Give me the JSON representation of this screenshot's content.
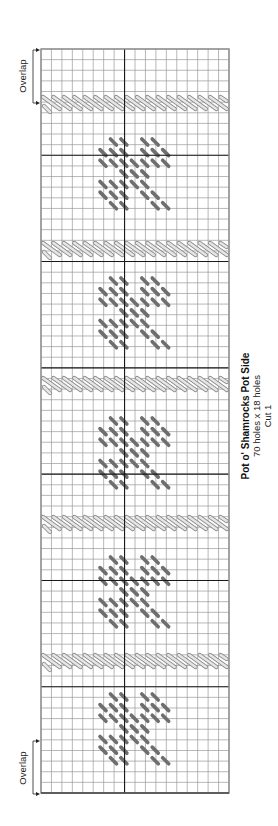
{
  "title": "Pot o' Shamrocks Pot Side",
  "dimensions": "70 holes x 18 holes",
  "cut": "Cut 1",
  "overlap_top": "Overlap",
  "overlap_bottom": "Overlap",
  "grid": {
    "rows": 70,
    "cols": 18,
    "left": 41,
    "top": 49,
    "width": 188,
    "height": 744,
    "major_every": 10,
    "center_col": 8,
    "line_color": "#9a9a9a",
    "major_color": "#1a1a1a",
    "border_color": "#8c8c8c"
  },
  "colors": {
    "shamrock_stitch": "#6e6e6e",
    "band_stitch_fill": "#e6e6e6",
    "band_stitch_stroke": "#8a8a8a"
  },
  "bands_y": [
    97,
    243,
    378,
    517,
    655
  ],
  "shamrocks_y": [
    142,
    281,
    421,
    560,
    697
  ],
  "shamrock_pattern": [
    [
      1,
      2,
      4,
      5
    ],
    [
      0,
      1,
      2,
      4,
      5,
      6
    ],
    [
      0,
      1,
      2,
      3,
      4,
      5,
      6
    ],
    [
      2,
      3,
      4
    ],
    [
      0,
      1,
      2,
      3,
      4
    ],
    [
      0,
      1,
      2,
      4,
      5
    ],
    [
      1,
      2,
      5,
      6
    ]
  ]
}
